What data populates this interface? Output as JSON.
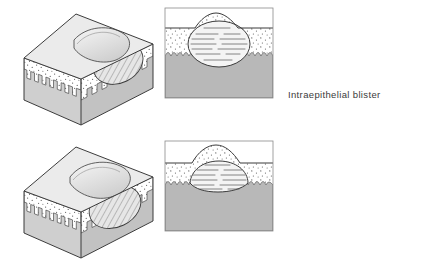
{
  "figure": {
    "background_color": "#ffffff",
    "line_color": "#3b3b3b",
    "text_color": "#3b3b3b",
    "rows": [
      {
        "id": "intraepithelial",
        "label": "Intraepithelial blister",
        "blister_location": "within the epithelium",
        "views": [
          "three-dimensional-block",
          "cross-section"
        ]
      },
      {
        "id": "subepithelial",
        "label": "Subepithelial blister",
        "blister_location": "beneath the epithelium",
        "views": [
          "three-dimensional-block",
          "cross-section"
        ]
      }
    ],
    "layers": [
      {
        "name": "dermis",
        "fill": "#b8b8b8",
        "pattern": "solid gray"
      },
      {
        "name": "basement-membrane",
        "fill": "#ffffff",
        "pattern": "wavy comb-like projections"
      },
      {
        "name": "epithelium",
        "fill": "#ffffff",
        "pattern": "stipple dots"
      },
      {
        "name": "blister-cavity",
        "fill": "#f2f2f2",
        "pattern": "horizontal dashed fluid lines"
      }
    ],
    "block_faces": [
      {
        "name": "top-surface",
        "fill": "#ebebeb"
      },
      {
        "name": "front-cut-face",
        "fill": "#d2d2d2"
      },
      {
        "name": "side-cut-face",
        "fill": "#c4c4c4"
      }
    ]
  }
}
